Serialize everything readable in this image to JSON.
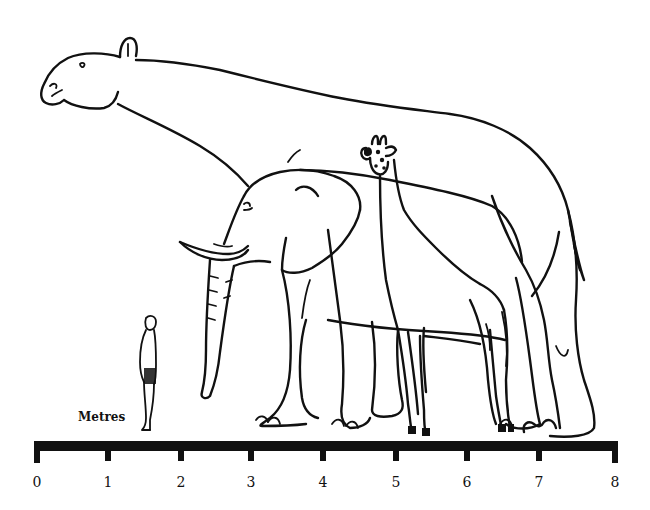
{
  "figure": {
    "subjects": [
      {
        "id": "paraceratherium",
        "label": "giant hornless rhinoceros"
      },
      {
        "id": "elephant",
        "label": "elephant"
      },
      {
        "id": "giraffe",
        "label": "giraffe"
      },
      {
        "id": "human",
        "label": "human"
      }
    ]
  },
  "scale": {
    "unit_label": "Metres",
    "ticks": [
      "0",
      "1",
      "2",
      "3",
      "4",
      "5",
      "6",
      "7",
      "8"
    ],
    "bar_color": "#111111"
  },
  "colors": {
    "ink": "#111111",
    "background": "#ffffff"
  }
}
